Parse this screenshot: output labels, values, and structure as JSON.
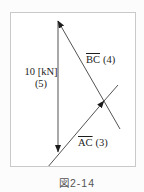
{
  "figure_caption": "図2-14",
  "labels": {
    "load_force": {
      "line1": "10 [kN]",
      "line2": "(5)"
    },
    "member_bc": {
      "name": "BC",
      "value": "(4)"
    },
    "member_ac": {
      "name": "AC",
      "value": "(3)"
    }
  },
  "colors": {
    "diagram_line": "#3f3f3f",
    "arrowhead": "#1c1c1c",
    "frame_border": "#c9c9c9",
    "label_text": "#1d1d1d",
    "caption_text": "#555555"
  }
}
